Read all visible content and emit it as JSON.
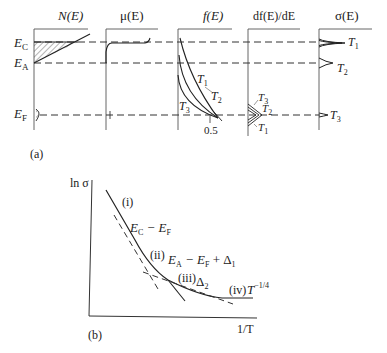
{
  "figure": {
    "panel_a": {
      "label": "(a)",
      "columns": [
        {
          "title": "N(E)"
        },
        {
          "title": "μ(E)"
        },
        {
          "title": "f(E)"
        },
        {
          "title": "df(E)/dE"
        },
        {
          "title": "σ(E)"
        }
      ],
      "levels": {
        "ec": {
          "base": "E",
          "sub": "C"
        },
        "ea": {
          "base": "E",
          "sub": "A"
        },
        "ef": {
          "base": "E",
          "sub": "F"
        }
      },
      "f_curves": [
        {
          "label": "T",
          "sub": "1"
        },
        {
          "label": "T",
          "sub": "2"
        },
        {
          "label": "T",
          "sub": "3"
        }
      ],
      "f_tick": "0.5",
      "df_curves": [
        {
          "label": "T",
          "sub": "3"
        },
        {
          "label": "T",
          "sub": "2"
        },
        {
          "label": "T",
          "sub": "1"
        }
      ],
      "sigma_peaks": [
        {
          "label": "T",
          "sub": "1"
        },
        {
          "label": "T",
          "sub": "2"
        },
        {
          "label": "T",
          "sub": "3"
        }
      ]
    },
    "panel_b": {
      "label": "(b)",
      "ylabel": "ln σ",
      "xlabel": "1/T",
      "regions": [
        {
          "id": "(i)",
          "text": "E",
          "sub1": "C",
          "rest": " − E",
          "sub2": "F"
        },
        {
          "id": "(ii)",
          "text": "E",
          "sub1": "A",
          "rest": " − E",
          "sub2": "F",
          "tail": " + Δ",
          "sub3": "1"
        },
        {
          "id": "(iii)",
          "text": "Δ",
          "sub1": "2"
        },
        {
          "id": "(iv)",
          "text": "T",
          "sup": "−1/4"
        }
      ]
    }
  }
}
